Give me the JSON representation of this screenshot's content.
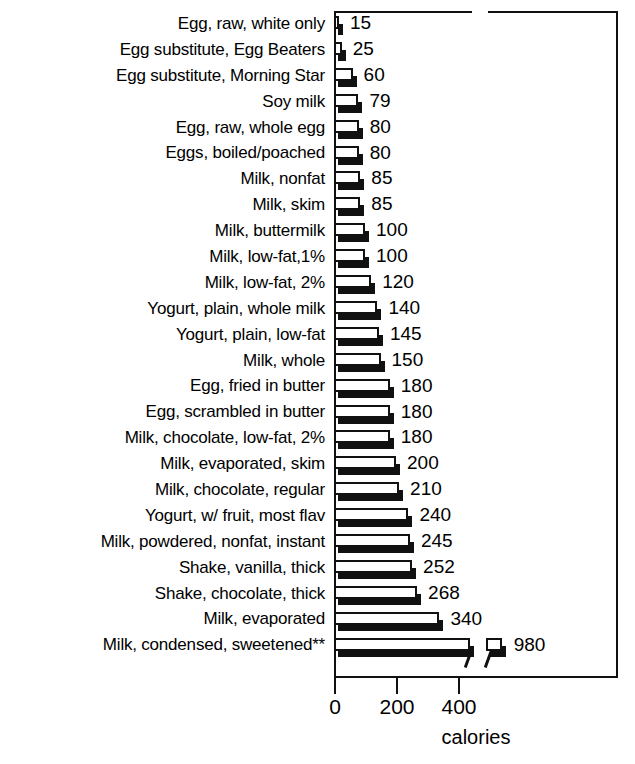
{
  "chart_data": {
    "type": "bar",
    "orientation": "horizontal",
    "title": "",
    "xlabel": "calories",
    "ylabel": "",
    "xlim": [
      0,
      460
    ],
    "xticks": [
      0,
      200,
      400
    ],
    "xtick_labels": [
      "0",
      "200",
      "400"
    ],
    "grid": false,
    "legend": null,
    "axis_break": {
      "present": true,
      "after_value": 440,
      "note": "x-axis is broken just past 400; the final bar continues beyond the break"
    },
    "footnote_marker": "**",
    "categories": [
      "Egg, raw, white only",
      "Egg substitute, Egg Beaters",
      "Egg substitute, Morning Star",
      "Soy milk",
      "Egg, raw, whole egg",
      "Eggs, boiled/poached",
      "Milk, nonfat",
      "Milk, skim",
      "Milk, buttermilk",
      "Milk, low-fat,1%",
      "Milk, low-fat, 2%",
      "Yogurt, plain, whole milk",
      "Yogurt, plain, low-fat",
      "Milk, whole",
      "Egg, fried in butter",
      "Egg, scrambled in butter",
      "Milk, chocolate, low-fat, 2%",
      "Milk, evaporated, skim",
      "Milk, chocolate, regular",
      "Yogurt, w/ fruit, most flav",
      "Milk, powdered, nonfat, instant",
      "Shake, vanilla, thick",
      "Shake, chocolate, thick",
      "Milk, evaporated",
      "Milk, condensed, sweetened**"
    ],
    "values": [
      15,
      25,
      60,
      79,
      80,
      80,
      85,
      85,
      100,
      100,
      120,
      140,
      145,
      150,
      180,
      180,
      180,
      200,
      210,
      240,
      245,
      252,
      268,
      340,
      980
    ],
    "value_labels": [
      "15",
      "25",
      "60",
      "79",
      "80",
      "80",
      "85",
      "85",
      "100",
      "100",
      "120",
      "140",
      "145",
      "150",
      "180",
      "180",
      "180",
      "200",
      "210",
      "240",
      "245",
      "252",
      "268",
      "340",
      "980"
    ]
  },
  "style": {
    "bar_face_color": "#ffffff",
    "bar_outline_color": "#111111",
    "bar_shadow_color": "#111111",
    "background_color": "#ffffff",
    "text_color": "#000000"
  }
}
